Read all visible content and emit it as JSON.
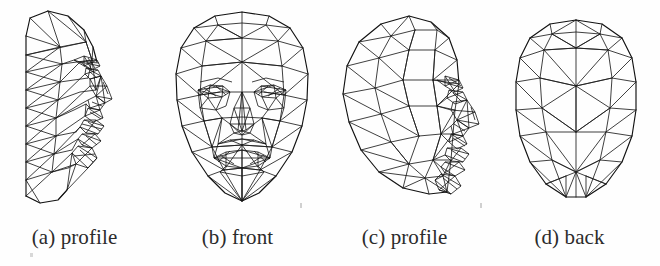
{
  "figure": {
    "kind": "wireframe-mesh-figure",
    "background_color": "#fefefe",
    "line_color": "#1d1d1d",
    "panel_count": 4,
    "panels": [
      {
        "id": "a",
        "caption": "(a) profile",
        "view": "profile",
        "mesh_style": "dense-triangulated-side-view"
      },
      {
        "id": "b",
        "caption": "(b) front",
        "view": "front",
        "mesh_style": "symmetric-triangulated-front-view"
      },
      {
        "id": "c",
        "caption": "(c) profile",
        "view": "profile",
        "mesh_style": "coarse-triangulated-side-view"
      },
      {
        "id": "d",
        "caption": "(d) back",
        "view": "back",
        "mesh_style": "coarse-triangulated-back-view"
      }
    ]
  },
  "captions": {
    "a": "(a) profile",
    "b": "(b) front",
    "c": "(c) profile",
    "d": "(d) back"
  }
}
